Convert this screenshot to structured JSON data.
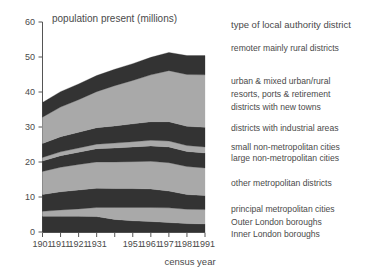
{
  "figure": {
    "plot_title": "population present (millions)",
    "xaxis_title": "census year",
    "legend_heading": "type of local authority district"
  },
  "colors": {
    "band_dark": "#333333",
    "band_light": "#a9a9a9",
    "axis": "#555555",
    "text": "#4a4a4a",
    "background": "#ffffff"
  },
  "chart_data": {
    "type": "area",
    "title": "population present (millions)",
    "xlabel": "census year",
    "ylabel": "population present (millions)",
    "x": [
      1901,
      1911,
      1921,
      1931,
      1941,
      1951,
      1961,
      1971,
      1981,
      1991
    ],
    "xtick_labels": [
      "1901",
      "1911",
      "1921",
      "1931",
      "",
      "1951",
      "1961",
      "1971",
      "1981",
      "1991"
    ],
    "xlim": [
      1901,
      1991
    ],
    "ylim": [
      0,
      60
    ],
    "ytick_labels": [
      "0",
      "10",
      "20",
      "30",
      "40",
      "50",
      "60"
    ],
    "yticks": [
      0,
      10,
      20,
      30,
      40,
      50,
      60
    ],
    "grid": false,
    "legend_position": "right",
    "stacked": true,
    "stack_order": "bottom-to-top",
    "series": [
      {
        "name": "Inner London boroughs",
        "legend_label": "Inner London boroughs",
        "shade": "dark",
        "values": [
          4.5,
          4.5,
          4.5,
          4.4,
          3.6,
          3.2,
          3.0,
          2.7,
          2.4,
          2.3
        ]
      },
      {
        "name": "Outer London boroughs",
        "legend_label": "Outer London boroughs",
        "shade": "light",
        "values": [
          1.4,
          1.8,
          2.1,
          2.6,
          3.4,
          3.8,
          4.0,
          4.2,
          4.1,
          4.1
        ]
      },
      {
        "name": "principal metropolitan cities",
        "legend_label": "principal metropolitan cities",
        "shade": "dark",
        "values": [
          4.8,
          5.2,
          5.4,
          5.5,
          5.4,
          5.4,
          5.3,
          4.8,
          4.2,
          4.0
        ]
      },
      {
        "name": "other metropolitan districts",
        "legend_label": "other metropolitan districts",
        "shade": "light",
        "values": [
          6.6,
          7.0,
          7.3,
          7.5,
          7.6,
          7.7,
          7.9,
          8.1,
          8.0,
          7.9
        ]
      },
      {
        "name": "large non-metropolitan cities",
        "legend_label": "large non-metropolitan cities",
        "shade": "dark",
        "values": [
          3.0,
          3.3,
          3.5,
          3.8,
          4.0,
          4.2,
          4.4,
          4.5,
          4.3,
          4.3
        ]
      },
      {
        "name": "small non-metropolitan cities",
        "legend_label": "small non-metropolitan cities",
        "shade": "light",
        "values": [
          1.0,
          1.1,
          1.2,
          1.3,
          1.4,
          1.5,
          1.6,
          1.7,
          1.7,
          1.7
        ]
      },
      {
        "name": "districts with industrial areas",
        "legend_label": "districts with industrial areas",
        "shade": "dark",
        "values": [
          4.0,
          4.3,
          4.5,
          4.7,
          4.9,
          5.1,
          5.3,
          5.5,
          5.5,
          5.6
        ]
      },
      {
        "name": "districts with new towns / resorts, ports & retirement / urban & mixed urban-rural",
        "legend_label": "urban & mixed urban/rural",
        "shade": "light",
        "values": [
          7.5,
          8.5,
          9.3,
          10.3,
          11.5,
          12.4,
          13.4,
          14.6,
          14.8,
          15.0
        ]
      },
      {
        "name": "remoter mainly rural districts",
        "legend_label": "remoter mainly rural districts",
        "shade": "dark",
        "values": [
          4.2,
          4.4,
          4.5,
          4.6,
          4.7,
          4.8,
          5.0,
          5.2,
          5.4,
          5.5
        ]
      }
    ],
    "totals": [
      37.0,
      40.1,
      42.3,
      44.7,
      46.5,
      48.1,
      49.9,
      51.3,
      50.4,
      50.4
    ]
  },
  "legend": {
    "heading": "type of local authority district",
    "entries": [
      {
        "label": "remoter mainly rural districts"
      },
      {
        "label": "urban & mixed urban/rural"
      },
      {
        "label": "resorts, ports & retirement"
      },
      {
        "label": "districts with new towns"
      },
      {
        "label": "districts with industrial areas"
      },
      {
        "label": "small non-metropolitan cities"
      },
      {
        "label": "large non-metropolitan cities"
      },
      {
        "label": "other metropolitan districts"
      },
      {
        "label": "principal metropolitan cities"
      },
      {
        "label": "Outer London boroughs"
      },
      {
        "label": "Inner London boroughs"
      }
    ]
  }
}
